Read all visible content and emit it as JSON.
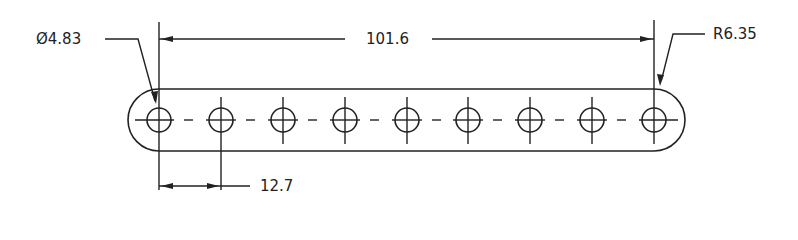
{
  "drawing": {
    "title": "Slotted link bar with 9 holes",
    "units": "mm",
    "dimensions": {
      "hole_diameter": "Ø4.83",
      "overall_center_span": "101.6",
      "end_radius": "R6.35",
      "hole_pitch": "12.7"
    },
    "hole_count": 9,
    "colors": {
      "line": "#222222",
      "background": "#ffffff"
    }
  }
}
